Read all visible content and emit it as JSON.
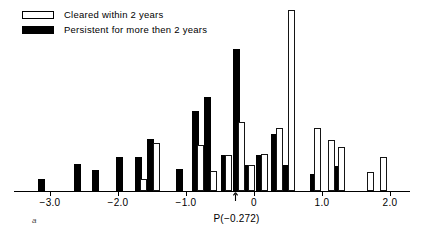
{
  "legend": {
    "items": [
      {
        "label": "Cleared within 2 years",
        "swatch": "open",
        "color": "#ffffff"
      },
      {
        "label": "Persistent for more then 2 years",
        "swatch": "filled",
        "color": "#000000"
      }
    ]
  },
  "annotations": {
    "p_marker_label": "P(−0.272)",
    "p_marker_x": -0.272,
    "panel_label": "a"
  },
  "chart_data": {
    "type": "bar",
    "title": "",
    "subtitle": "",
    "xlabel": "",
    "ylabel": "",
    "xlim": [
      -3.35,
      2.15
    ],
    "ylim": [
      0,
      22
    ],
    "grid": false,
    "legend_position": "top-left",
    "bin_width": 0.15,
    "xtick_values": [
      -3.0,
      -2.0,
      -1.0,
      0,
      1.0,
      2.0
    ],
    "xtick_labels": [
      "−3.0",
      "−2.0",
      "−1.0",
      "0",
      "1.0",
      "2.0"
    ],
    "series": [
      {
        "name": "Persistent for more then 2 years",
        "style": "filled",
        "color": "#000000",
        "points": [
          {
            "x": -3.12,
            "y": 1.4
          },
          {
            "x": -2.6,
            "y": 3.1
          },
          {
            "x": -2.33,
            "y": 2.4
          },
          {
            "x": -1.98,
            "y": 4.0
          },
          {
            "x": -1.7,
            "y": 4.0
          },
          {
            "x": -1.52,
            "y": 6.1
          },
          {
            "x": -1.1,
            "y": 2.5
          },
          {
            "x": -0.86,
            "y": 9.4
          },
          {
            "x": -0.68,
            "y": 11.0
          },
          {
            "x": -0.44,
            "y": 4.2
          },
          {
            "x": -0.26,
            "y": 16.6
          },
          {
            "x": -0.1,
            "y": 3.0
          },
          {
            "x": 0.08,
            "y": 4.2
          },
          {
            "x": 0.3,
            "y": 6.6
          },
          {
            "x": 0.47,
            "y": 3.0
          },
          {
            "x": 0.87,
            "y": 1.9
          },
          {
            "x": 1.21,
            "y": 2.9
          }
        ]
      },
      {
        "name": "Cleared within 2 years",
        "style": "open",
        "color": "#ffffff",
        "points": [
          {
            "x": -1.63,
            "y": 1.3
          },
          {
            "x": -1.43,
            "y": 5.6
          },
          {
            "x": -0.79,
            "y": 5.3
          },
          {
            "x": -0.6,
            "y": 2.3
          },
          {
            "x": -0.37,
            "y": 4.2
          },
          {
            "x": -0.19,
            "y": 8.1
          },
          {
            "x": -0.03,
            "y": 3.0
          },
          {
            "x": 0.15,
            "y": 4.3
          },
          {
            "x": 0.37,
            "y": 7.3
          },
          {
            "x": 0.55,
            "y": 21.2
          },
          {
            "x": 0.94,
            "y": 7.3
          },
          {
            "x": 1.14,
            "y": 6.0
          },
          {
            "x": 1.29,
            "y": 5.1
          },
          {
            "x": 1.72,
            "y": 2.2
          },
          {
            "x": 1.91,
            "y": 4.0
          }
        ]
      }
    ]
  }
}
